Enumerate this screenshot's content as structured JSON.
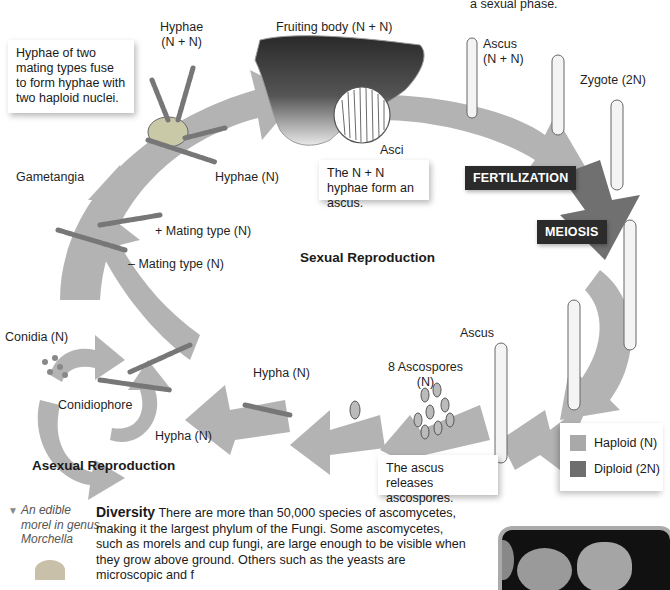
{
  "header": {
    "fragment": "a sexual phase."
  },
  "diagram": {
    "title_sexual": "Sexual Reproduction",
    "title_asexual": "Asexual Reproduction",
    "labels": {
      "hyphae_nn": [
        "Hyphae",
        "(N + N)"
      ],
      "fruiting_body": "Fruiting body (N + N)",
      "ascus_nn": [
        "Ascus",
        "(N + N)"
      ],
      "zygote": "Zygote (2N)",
      "asci": "Asci",
      "hyphae_n": "Hyphae (N)",
      "gametangia": "Gametangia",
      "plus_mating": "+ Mating type (N)",
      "minus_mating": "– Mating type (N)",
      "conidia": "Conidia (N)",
      "conidiophore": "Conidiophore",
      "hypha_n_1": "Hypha (N)",
      "hypha_n_2": "Hypha (N)",
      "ascus": "Ascus",
      "ascospores": [
        "8 Ascospores",
        "(N)"
      ]
    },
    "callouts": {
      "fuse": "Hyphae of two mating types fuse to form hyphae with two haploid nuclei.",
      "ascus_form": "The N + N hyphae form an ascus.",
      "release": "The ascus releases ascospores."
    },
    "stages": {
      "fertilization": "FERTILIZATION",
      "meiosis": "MEIOSIS"
    },
    "legend": [
      {
        "label": "Haploid (N)",
        "color": "#a9a9a9"
      },
      {
        "label": "Diploid (2N)",
        "color": "#6e6e6e"
      }
    ],
    "colors": {
      "haploid_arrow": "#b0b0b0",
      "diploid_arrow": "#707070",
      "tag_bg": "#2b2b2b"
    }
  },
  "caption": {
    "line1": "An edible",
    "line2": "morel in genus",
    "line3": "Morchella"
  },
  "body": {
    "heading": "Diversity",
    "text": " There are more than 50,000 species of ascomycetes, making it the largest phylum of the Fungi. Some ascomycetes, such as morels and cup fungi, are large enough to be visible when they grow above ground. Others such as the yeasts are microscopic and f"
  }
}
